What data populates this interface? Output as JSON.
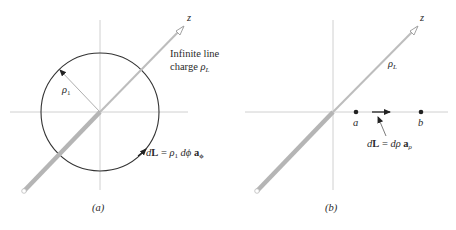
{
  "figure": {
    "panel_a": {
      "caption": "(a)",
      "axis_label_z": "z",
      "line_charge_label_line1": "Infinite line",
      "line_charge_label_line2": "charge",
      "line_charge_symbol": "ρ",
      "line_charge_subscript": "L",
      "radius_symbol": "ρ",
      "radius_subscript": "1",
      "dl_expression": {
        "d": "d",
        "L": "L",
        "eq": " = ",
        "rho": "ρ",
        "rho_sub": "1",
        "dphi": " dϕ ",
        "unit": "a",
        "unit_sub": "ϕ"
      }
    },
    "panel_b": {
      "caption": "(b)",
      "axis_label_z": "z",
      "line_charge_symbol": "ρ",
      "line_charge_subscript": "L",
      "point_a": "a",
      "point_b": "b",
      "dl_expression": {
        "d": "d",
        "L": "L",
        "eq": " = ",
        "drho": "dρ ",
        "unit": "a",
        "unit_sub": "ρ"
      }
    },
    "colors": {
      "axis": "#bbbbbb",
      "line_charge": "#b8b8b8",
      "circle": "#333333",
      "text": "#2a2a2a"
    }
  }
}
